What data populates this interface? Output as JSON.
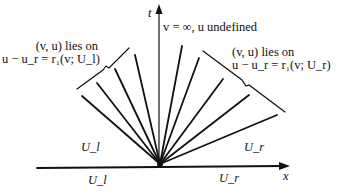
{
  "diagram": {
    "type": "rarefaction-fan",
    "axes": {
      "vertical": "t",
      "horizontal": "x"
    },
    "top_label": "v = ∞, u undefined",
    "left_annotation": {
      "line1": "(v, u) lies on",
      "line2": "u − u_r = r₁(v; U_l)"
    },
    "right_annotation": {
      "line1": "(v, u) lies on",
      "line2": "u − u_r = r₁(v; U_r)"
    },
    "regions": {
      "upper_left": "U_l",
      "upper_right": "U_r",
      "lower_left": "U_l",
      "lower_right": "U_r"
    }
  },
  "colors": {
    "ink": "#111111",
    "background": "#ffffff"
  }
}
